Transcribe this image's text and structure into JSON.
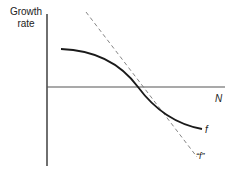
{
  "diagram": {
    "y_axis_label_line1": "Growth",
    "y_axis_label_line2": "rate",
    "x_axis_label": "N",
    "curve_label": "f",
    "tangent_label": "“f”",
    "colors": {
      "axis": "#333333",
      "curve": "#1a1a1a",
      "tangent": "#777777",
      "background": "#ffffff"
    }
  }
}
